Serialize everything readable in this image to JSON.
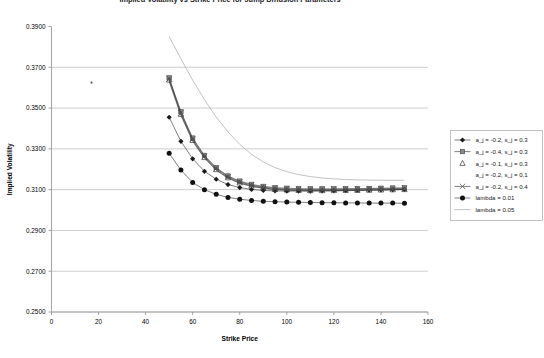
{
  "figure": {
    "title_clipped": "Implied Volatility vs Strike Price for Jump Diffusion Parameters",
    "title_visible": false,
    "background_color": "#ffffff",
    "frame_color": "#9a9a9a",
    "grid_color": "#b9b9b9"
  },
  "axis": {
    "x_label": "Strike Price",
    "y_label": "Implied Volatility",
    "x_ticks": [
      "0",
      "20",
      "40",
      "60",
      "80",
      "100",
      "120",
      "140",
      "160"
    ],
    "y_ticks": [
      "0.2500",
      "0.2700",
      "0.2900",
      "0.3100",
      "0.3300",
      "0.3500",
      "0.3700",
      "0.3900"
    ]
  },
  "legend": {
    "position": "right",
    "items": [
      {
        "label": "a_j = -0.2, s_j = 0.3",
        "marker": "diamond",
        "line": true
      },
      {
        "label": "a_j = -0.4, s_j = 0.3",
        "marker": "square",
        "line": true
      },
      {
        "label": "a_j = -0.1, s_j = 0.3",
        "marker": "triangle",
        "line": false
      },
      {
        "label": "a_j = -0.2, s_j = 0.1",
        "marker": "none",
        "line": false
      },
      {
        "label": "a_j = -0.2, s_j = 0.4",
        "marker": "cross",
        "line": true
      },
      {
        "label": "lambda = 0.01",
        "marker": "circle",
        "line": true
      },
      {
        "label": "lambda = 0.05",
        "marker": "none",
        "line": true
      }
    ]
  },
  "artifacts": {
    "stray_dot": {
      "x": 17.0,
      "y": 0.3625
    }
  },
  "chart_data": {
    "type": "line",
    "title": "",
    "xlabel": "Strike Price",
    "ylabel": "Implied Volatility",
    "xlim": [
      0,
      160
    ],
    "ylim": [
      0.25,
      0.39
    ],
    "xticks": [
      0,
      20,
      40,
      60,
      80,
      100,
      120,
      140,
      160
    ],
    "yticks": [
      0.25,
      0.27,
      0.29,
      0.31,
      0.33,
      0.35,
      0.37,
      0.39
    ],
    "grid": "horizontal",
    "legend_position": "right",
    "x": [
      50,
      55,
      60,
      65,
      70,
      75,
      80,
      85,
      90,
      95,
      100,
      105,
      110,
      115,
      120,
      125,
      130,
      135,
      140,
      145,
      150
    ],
    "series": [
      {
        "name": "a_j = -0.2, s_j = 0.3",
        "marker": "diamond",
        "values": [
          0.3455,
          0.3337,
          0.3251,
          0.319,
          0.3151,
          0.3125,
          0.311,
          0.3101,
          0.3096,
          0.3094,
          0.3093,
          0.3093,
          0.3093,
          0.3094,
          0.3095,
          0.3096,
          0.3097,
          0.3098,
          0.3099,
          0.31,
          0.3101
        ]
      },
      {
        "name": "a_j = -0.4, s_j = 0.3",
        "marker": "square",
        "values": [
          0.3648,
          0.3482,
          0.3353,
          0.3268,
          0.3208,
          0.3167,
          0.3142,
          0.3126,
          0.3116,
          0.311,
          0.3107,
          0.3105,
          0.3104,
          0.3104,
          0.3104,
          0.3105,
          0.3105,
          0.3106,
          0.3107,
          0.3108,
          0.3109
        ]
      },
      {
        "name": "a_j = -0.1, s_j = 0.3",
        "marker": "triangle",
        "values": [
          0.3638,
          0.347,
          0.3342,
          0.3258,
          0.3199,
          0.3159,
          0.3134,
          0.3118,
          0.3108,
          0.3102,
          0.3099,
          0.3097,
          0.3096,
          0.3096,
          0.3096,
          0.3097,
          0.3097,
          0.3098,
          0.3099,
          0.31,
          0.3101
        ]
      },
      {
        "name": "a_j = -0.2, s_j = 0.1",
        "marker": "none",
        "values": [
          0.363,
          0.3464,
          0.3337,
          0.3254,
          0.3195,
          0.3156,
          0.3131,
          0.3116,
          0.3106,
          0.31,
          0.3097,
          0.3095,
          0.3094,
          0.3094,
          0.3094,
          0.3095,
          0.3096,
          0.3097,
          0.3098,
          0.3099,
          0.31
        ]
      },
      {
        "name": "a_j = -0.2, s_j = 0.4",
        "marker": "cross",
        "values": [
          0.3643,
          0.3476,
          0.3348,
          0.3263,
          0.3204,
          0.3163,
          0.3138,
          0.3122,
          0.3112,
          0.3106,
          0.3103,
          0.3101,
          0.31,
          0.31,
          0.3101,
          0.3101,
          0.3102,
          0.3103,
          0.3104,
          0.3105,
          0.3106
        ]
      },
      {
        "name": "lambda = 0.01",
        "marker": "circle",
        "values": [
          0.3278,
          0.3196,
          0.3135,
          0.31,
          0.3077,
          0.3062,
          0.3053,
          0.3047,
          0.3043,
          0.3041,
          0.3039,
          0.3038,
          0.3037,
          0.3036,
          0.3036,
          0.3035,
          0.3035,
          0.3034,
          0.3034,
          0.3034,
          0.3033
        ]
      },
      {
        "name": "lambda = 0.05",
        "marker": "none",
        "values": [
          0.3851,
          0.3741,
          0.3637,
          0.3541,
          0.3456,
          0.3383,
          0.3322,
          0.3273,
          0.3236,
          0.3208,
          0.3188,
          0.3174,
          0.3164,
          0.3157,
          0.3153,
          0.315,
          0.3148,
          0.3147,
          0.3146,
          0.3146,
          0.3146
        ]
      }
    ]
  }
}
